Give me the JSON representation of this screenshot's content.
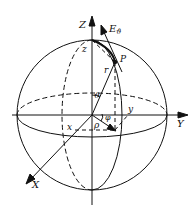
{
  "diagram": {
    "labels": {
      "Z_axis": "Z",
      "Y_axis": "Y",
      "X_axis": "X",
      "z": "z",
      "y": "y",
      "x": "x",
      "point": "P",
      "radius": "r",
      "theta": "ϑ",
      "phi": "φ",
      "rho": "ρ",
      "E_theta": "E",
      "E_theta_sub": "ϑ"
    },
    "stroke_color": "#111111",
    "background_color": "#ffffff"
  }
}
